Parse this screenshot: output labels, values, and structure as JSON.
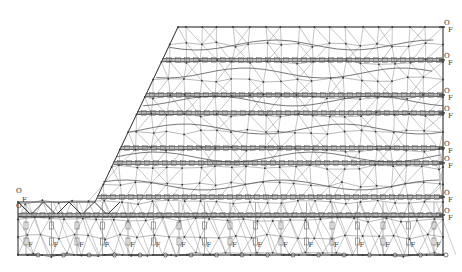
{
  "figure": {
    "type": "finite-element mesh of reinforced slope with tiered anchor rows",
    "colors": {
      "mesh": "#8a8a8a",
      "beam": "#3a3a3a",
      "node": "#333333",
      "background": "#ffffff"
    },
    "slope": {
      "crest_y": 27,
      "crest_x_left": 178,
      "right_x": 443,
      "toe_x": 95,
      "berm_y": 202,
      "left_x": 18,
      "base_y": 255
    },
    "right_anchor_rows": [
      {
        "y": 27,
        "labels": [
          "O",
          "F"
        ]
      },
      {
        "y": 60,
        "labels": [
          "O",
          "F"
        ]
      },
      {
        "y": 95,
        "labels": [
          "O",
          "F"
        ]
      },
      {
        "y": 113,
        "labels": [
          "O",
          "F"
        ]
      },
      {
        "y": 148,
        "labels": [
          "O",
          "F"
        ]
      },
      {
        "y": 163,
        "labels": [
          "O",
          "F"
        ]
      },
      {
        "y": 197,
        "labels": [
          "O",
          "F"
        ]
      },
      {
        "y": 215,
        "labels": [
          "O",
          "F"
        ]
      }
    ],
    "left_labels": [
      {
        "y": 193,
        "text": "O"
      },
      {
        "y": 202,
        "text": "F"
      },
      {
        "y": 208,
        "text": "O"
      }
    ],
    "base_support_label": "O",
    "pile_label": "F"
  },
  "caption": ""
}
